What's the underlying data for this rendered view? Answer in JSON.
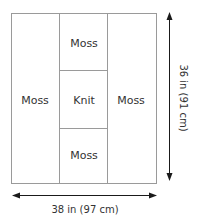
{
  "diagram": {
    "panels": [
      {
        "label": "Moss",
        "position": "left"
      },
      {
        "label": "Moss",
        "position": "center-top"
      },
      {
        "label": "Knit",
        "position": "center-middle"
      },
      {
        "label": "Moss",
        "position": "center-bottom"
      },
      {
        "label": "Moss",
        "position": "right"
      }
    ],
    "dimensions": {
      "width": "38 in (97 cm)",
      "height": "36 in (91 cm)"
    },
    "colors": {
      "border": "#9a9a9a",
      "arrow": "#1a1a1a",
      "text": "#333333"
    }
  }
}
